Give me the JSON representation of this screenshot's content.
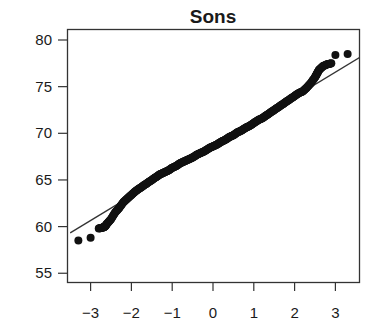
{
  "chart_data": {
    "type": "scatter",
    "subtype": "normal-qq-plot",
    "title": "Sons",
    "xlabel": "",
    "ylabel": "",
    "xlim": [
      -3.5,
      3.6
    ],
    "ylim": [
      54,
      81
    ],
    "x_ticks": [
      -3,
      -2,
      -1,
      0,
      1,
      2,
      3
    ],
    "x_tick_labels": [
      "−3",
      "−2",
      "−1",
      "0",
      "1",
      "2",
      "3"
    ],
    "y_ticks": [
      55,
      60,
      65,
      70,
      75,
      80
    ],
    "y_tick_labels": [
      "55",
      "60",
      "65",
      "70",
      "75",
      "80"
    ],
    "grid": false,
    "legend": null,
    "reference_line": {
      "intercept": 68.6,
      "slope": 2.65,
      "x_range": [
        -3.5,
        3.6
      ]
    },
    "series": [
      {
        "name": "sample quantiles",
        "points": [
          [
            -3.3,
            58.5
          ],
          [
            -3.0,
            58.8
          ],
          [
            -2.8,
            59.8
          ],
          [
            -2.7,
            59.9
          ],
          [
            -2.65,
            60.0
          ],
          [
            -2.6,
            60.3
          ],
          [
            -2.5,
            60.8
          ],
          [
            -2.4,
            61.5
          ],
          [
            -2.3,
            62.0
          ],
          [
            -2.2,
            62.6
          ],
          [
            -2.1,
            63.0
          ],
          [
            -2.0,
            63.4
          ],
          [
            -1.9,
            63.8
          ],
          [
            -1.8,
            64.1
          ],
          [
            -1.7,
            64.4
          ],
          [
            -1.6,
            64.7
          ],
          [
            -1.5,
            65.0
          ],
          [
            -1.4,
            65.3
          ],
          [
            -1.3,
            65.6
          ],
          [
            -1.2,
            65.8
          ],
          [
            -1.1,
            66.0
          ],
          [
            -1.0,
            66.3
          ],
          [
            -0.9,
            66.5
          ],
          [
            -0.8,
            66.8
          ],
          [
            -0.7,
            67.0
          ],
          [
            -0.6,
            67.2
          ],
          [
            -0.5,
            67.4
          ],
          [
            -0.4,
            67.7
          ],
          [
            -0.3,
            67.9
          ],
          [
            -0.2,
            68.1
          ],
          [
            -0.1,
            68.4
          ],
          [
            0.0,
            68.6
          ],
          [
            0.1,
            68.8
          ],
          [
            0.2,
            69.1
          ],
          [
            0.3,
            69.3
          ],
          [
            0.4,
            69.6
          ],
          [
            0.5,
            69.8
          ],
          [
            0.6,
            70.1
          ],
          [
            0.7,
            70.3
          ],
          [
            0.8,
            70.6
          ],
          [
            0.9,
            70.8
          ],
          [
            1.0,
            71.1
          ],
          [
            1.1,
            71.4
          ],
          [
            1.2,
            71.6
          ],
          [
            1.3,
            71.9
          ],
          [
            1.4,
            72.2
          ],
          [
            1.5,
            72.5
          ],
          [
            1.6,
            72.8
          ],
          [
            1.7,
            73.1
          ],
          [
            1.8,
            73.4
          ],
          [
            1.9,
            73.7
          ],
          [
            2.0,
            74.0
          ],
          [
            2.1,
            74.3
          ],
          [
            2.2,
            74.5
          ],
          [
            2.3,
            74.9
          ],
          [
            2.4,
            75.4
          ],
          [
            2.5,
            76.0
          ],
          [
            2.55,
            76.4
          ],
          [
            2.6,
            76.8
          ],
          [
            2.7,
            77.2
          ],
          [
            2.8,
            77.4
          ],
          [
            2.9,
            77.5
          ],
          [
            3.0,
            78.4
          ],
          [
            3.3,
            78.5
          ]
        ]
      }
    ],
    "marker": {
      "shape": "circle",
      "color": "#111111",
      "radius": 4
    },
    "line_color": "#333333",
    "axis_color": "#333333"
  }
}
